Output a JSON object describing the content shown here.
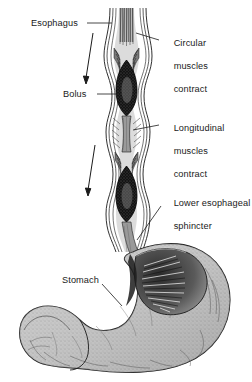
{
  "figure": {
    "type": "anatomical-illustration",
    "background_color": "#ffffff",
    "ink_color": "#1a1a1a",
    "width": 252,
    "height": 382
  },
  "labels": {
    "esophagus": {
      "text": "Esophagus",
      "lines": [
        "Esophagus"
      ],
      "side": "left",
      "x": 31,
      "y": 18
    },
    "circular_muscles": {
      "text": "Circular muscles contract",
      "lines": [
        "Circular",
        "muscles",
        "contract"
      ],
      "side": "right",
      "x": 163,
      "y": 27
    },
    "bolus": {
      "text": "Bolus",
      "lines": [
        "Bolus"
      ],
      "side": "left",
      "x": 63,
      "y": 89
    },
    "longitudinal_muscles": {
      "text": "Longitudinal muscles contract",
      "lines": [
        "Longitudinal",
        "muscles",
        "contract"
      ],
      "side": "right",
      "x": 163,
      "y": 112
    },
    "lower_esophageal_sphincter": {
      "text": "Lower esophageal sphincter",
      "lines": [
        "Lower esophageal",
        "sphincter"
      ],
      "side": "right",
      "x": 163,
      "y": 187
    },
    "stomach": {
      "text": "Stomach",
      "lines": [
        "Stomach"
      ],
      "side": "left",
      "x": 62,
      "y": 275
    }
  },
  "structures": {
    "esophagus_tube": "vertical muscular tube with striated wall layers running from top of figure down to stomach",
    "bolus_upper": "dark ovoid food mass in upper esophagus",
    "bolus_lower": "dark ovoid food mass in lower esophagus above sphincter",
    "contracted_segment": "narrow gray constricted esophageal segment between the two boluses",
    "lower_esophageal_sphincter": "narrowed junction where esophagus enters stomach",
    "stomach_body": "J-shaped stippled stomach with greater curvature at right and bottom",
    "gastric_rugae": "radiating internal folds shown in cutaway at the fundus/cardia",
    "duodenum": "curved tubular segment exiting at lower left"
  },
  "arrows": {
    "direction": "downward",
    "meaning": "direction of bolus movement / peristaltic wave",
    "count": 2
  },
  "colors": {
    "ink": "#1a1a1a",
    "bolus_dark": "#111111",
    "muscle_gray": "#8e8e8e",
    "tissue_light": "#c9c9c9",
    "tissue_mid": "#a6a6a6",
    "paper": "#ffffff"
  }
}
